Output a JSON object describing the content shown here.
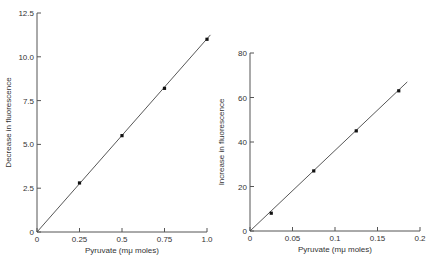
{
  "chart_data": [
    {
      "type": "scatter",
      "title": "",
      "xlabel": "Pyruvate (mμ moles)",
      "ylabel": "Decrease in fluorescence",
      "xlim": [
        0,
        1.0
      ],
      "ylim": [
        0,
        12.5
      ],
      "x_ticks": [
        "0",
        "0.25",
        "0.5",
        "0.75",
        "1.0"
      ],
      "y_ticks": [
        "0",
        "2.5",
        "5.0",
        "7.5",
        "10.0",
        "12.5"
      ],
      "grid": false,
      "series": [
        {
          "name": "data",
          "x": [
            0.25,
            0.5,
            0.75,
            1.0
          ],
          "y": [
            2.8,
            5.5,
            8.2,
            11.0
          ]
        }
      ],
      "fit_line": {
        "x": [
          0,
          1.02
        ],
        "y": [
          0,
          11.25
        ]
      }
    },
    {
      "type": "scatter",
      "title": "",
      "xlabel": "Pyruvate (mμ moles)",
      "ylabel": "Increase in fluorescence",
      "xlim": [
        0,
        0.2
      ],
      "ylim": [
        0,
        80
      ],
      "x_ticks": [
        "0",
        "0.05",
        "0.1",
        "0.15",
        "0.2"
      ],
      "y_ticks": [
        "0",
        "20",
        "40",
        "60",
        "80"
      ],
      "grid": false,
      "series": [
        {
          "name": "data",
          "x": [
            0.025,
            0.075,
            0.125,
            0.175
          ],
          "y": [
            8,
            27,
            45,
            63
          ]
        }
      ],
      "fit_line": {
        "x": [
          0,
          0.185
        ],
        "y": [
          0,
          67
        ]
      }
    }
  ]
}
